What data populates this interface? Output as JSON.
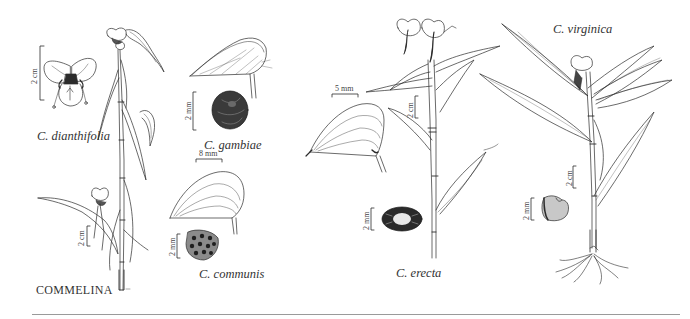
{
  "plate": {
    "genus": "COMMELINA",
    "species": [
      {
        "id": "dianthifolia",
        "label": "C. dianthifolia"
      },
      {
        "id": "gambiae",
        "label": "C. gambiae"
      },
      {
        "id": "communis",
        "label": "C. communis"
      },
      {
        "id": "erecta",
        "label": "C. erecta"
      },
      {
        "id": "virginica",
        "label": "C. virginica"
      }
    ],
    "scale_bars": {
      "dianthifolia_flower": "2 cm",
      "dianthifolia_plant": "2 cm",
      "gambiae_seed": "2 mm",
      "communis_spathe": "8 mm",
      "communis_seed": "2 mm",
      "erecta_spathe": "5 mm",
      "erecta_plant": "2 cm",
      "erecta_seed": "2 mm",
      "virginica_plant": "2 cm",
      "virginica_seed": "2 mm"
    }
  },
  "colors": {
    "ink": "#2b2b2b",
    "background": "#ffffff",
    "rule": "#9a9a9a"
  }
}
